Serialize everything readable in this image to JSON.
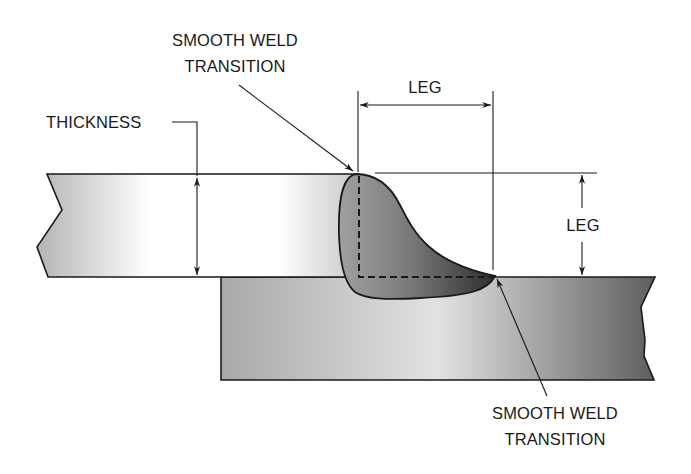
{
  "diagram": {
    "type": "fillet-weld-lap-joint",
    "labels": {
      "top_transition_line1": "SMOOTH WELD",
      "top_transition_line2": "TRANSITION",
      "thickness": "THICKNESS",
      "leg_horizontal": "LEG",
      "leg_vertical": "LEG",
      "bottom_transition_line1": "SMOOTH WELD",
      "bottom_transition_line2": "TRANSITION"
    },
    "components": [
      "top-plate",
      "bottom-plate",
      "fillet-weld",
      "weld-root-dashed-lines",
      "dimension-arrows",
      "leader-arrows"
    ],
    "colors": {
      "outline": "#1a1a1a",
      "top_plate_edge": "#b8b8b8",
      "top_plate_center": "#ffffff",
      "bottom_plate_light": "#d8d8d8",
      "bottom_plate_dark": "#6e6e6e",
      "weld_light": "#9a9a9a",
      "weld_dark": "#3a3a3a"
    }
  }
}
